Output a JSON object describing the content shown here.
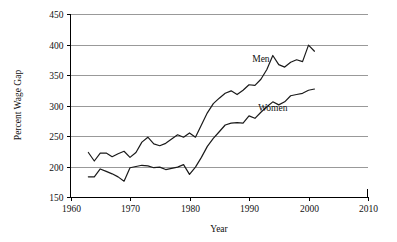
{
  "chart_data": {
    "type": "line",
    "title": "",
    "xlabel": "Year",
    "ylabel": "Percent Wage Gap",
    "xlim": [
      1960,
      2010
    ],
    "ylim": [
      150,
      450
    ],
    "xticks": [
      1960,
      1970,
      1980,
      1990,
      2000,
      2010
    ],
    "yticks": [
      150,
      200,
      250,
      300,
      350,
      400,
      450
    ],
    "grid": "horizontal",
    "legend_position": "inline-annotation",
    "series": [
      {
        "name": "Men",
        "label_x": 1992,
        "label_y": 372,
        "x": [
          1963,
          1964,
          1965,
          1966,
          1967,
          1968,
          1969,
          1970,
          1971,
          1972,
          1973,
          1974,
          1975,
          1976,
          1977,
          1978,
          1979,
          1980,
          1981,
          1982,
          1983,
          1984,
          1985,
          1986,
          1987,
          1988,
          1989,
          1990,
          1991,
          1992,
          1993,
          1994,
          1995,
          1996,
          1997,
          1998,
          1999,
          2000,
          2001
        ],
        "values": [
          223,
          209,
          222,
          222,
          216,
          221,
          225,
          215,
          223,
          240,
          248,
          237,
          234,
          238,
          245,
          252,
          248,
          255,
          248,
          268,
          288,
          303,
          312,
          320,
          324,
          318,
          325,
          334,
          333,
          343,
          359,
          382,
          367,
          363,
          371,
          375,
          372,
          399,
          389
        ]
      },
      {
        "name": "Women",
        "label_x": 1994,
        "label_y": 291,
        "x": [
          1963,
          1964,
          1965,
          1966,
          1967,
          1968,
          1969,
          1970,
          1971,
          1972,
          1973,
          1974,
          1975,
          1976,
          1977,
          1978,
          1979,
          1980,
          1981,
          1982,
          1983,
          1984,
          1985,
          1986,
          1987,
          1988,
          1989,
          1990,
          1991,
          1992,
          1993,
          1994,
          1995,
          1996,
          1997,
          1998,
          1999,
          2000,
          2001
        ],
        "values": [
          183,
          183,
          196,
          192,
          188,
          183,
          176,
          198,
          200,
          202,
          201,
          198,
          199,
          195,
          197,
          199,
          203,
          187,
          199,
          215,
          233,
          246,
          257,
          268,
          271,
          272,
          271,
          283,
          279,
          289,
          298,
          306,
          301,
          306,
          316,
          318,
          320,
          325,
          327
        ]
      }
    ]
  },
  "axis": {
    "ylabel": "Percent Wage Gap",
    "xlabel": "Year",
    "ytick_labels": [
      "450",
      "400",
      "350",
      "300",
      "250",
      "200",
      "150"
    ],
    "xtick_labels": [
      "1960",
      "1970",
      "1980",
      "1990",
      "2000",
      "2010"
    ]
  },
  "annotations": {
    "men_label": "Men",
    "women_label": "Women"
  },
  "colors": {
    "line": "#1a1a1a",
    "grid": "#808080",
    "axis": "#000000",
    "background": "#ffffff"
  }
}
